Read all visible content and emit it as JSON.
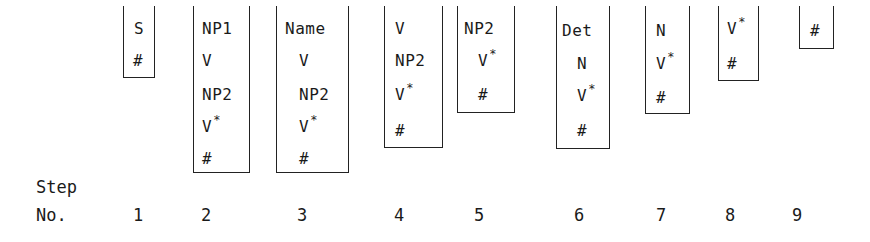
{
  "diagram": {
    "title": "",
    "steps_label_line1": "Step",
    "steps_label_line2": "No.",
    "stacks": [
      {
        "step": "1",
        "symbols": [
          "S",
          "#"
        ]
      },
      {
        "step": "2",
        "symbols": [
          "NP1",
          "V",
          "NP2",
          "V*",
          "#"
        ]
      },
      {
        "step": "3",
        "symbols": [
          "Name",
          "V",
          "NP2",
          "V*",
          "#"
        ]
      },
      {
        "step": "4",
        "symbols": [
          "V",
          "NP2",
          "V*",
          "#"
        ]
      },
      {
        "step": "5",
        "symbols": [
          "NP2",
          "V*",
          "#"
        ]
      },
      {
        "step": "6",
        "symbols": [
          "Det",
          "N",
          "V*",
          "#"
        ]
      },
      {
        "step": "7",
        "symbols": [
          "N",
          "V*",
          "#"
        ]
      },
      {
        "step": "8",
        "symbols": [
          "V*",
          "#"
        ]
      },
      {
        "step": "9",
        "symbols": [
          "#"
        ]
      }
    ]
  }
}
